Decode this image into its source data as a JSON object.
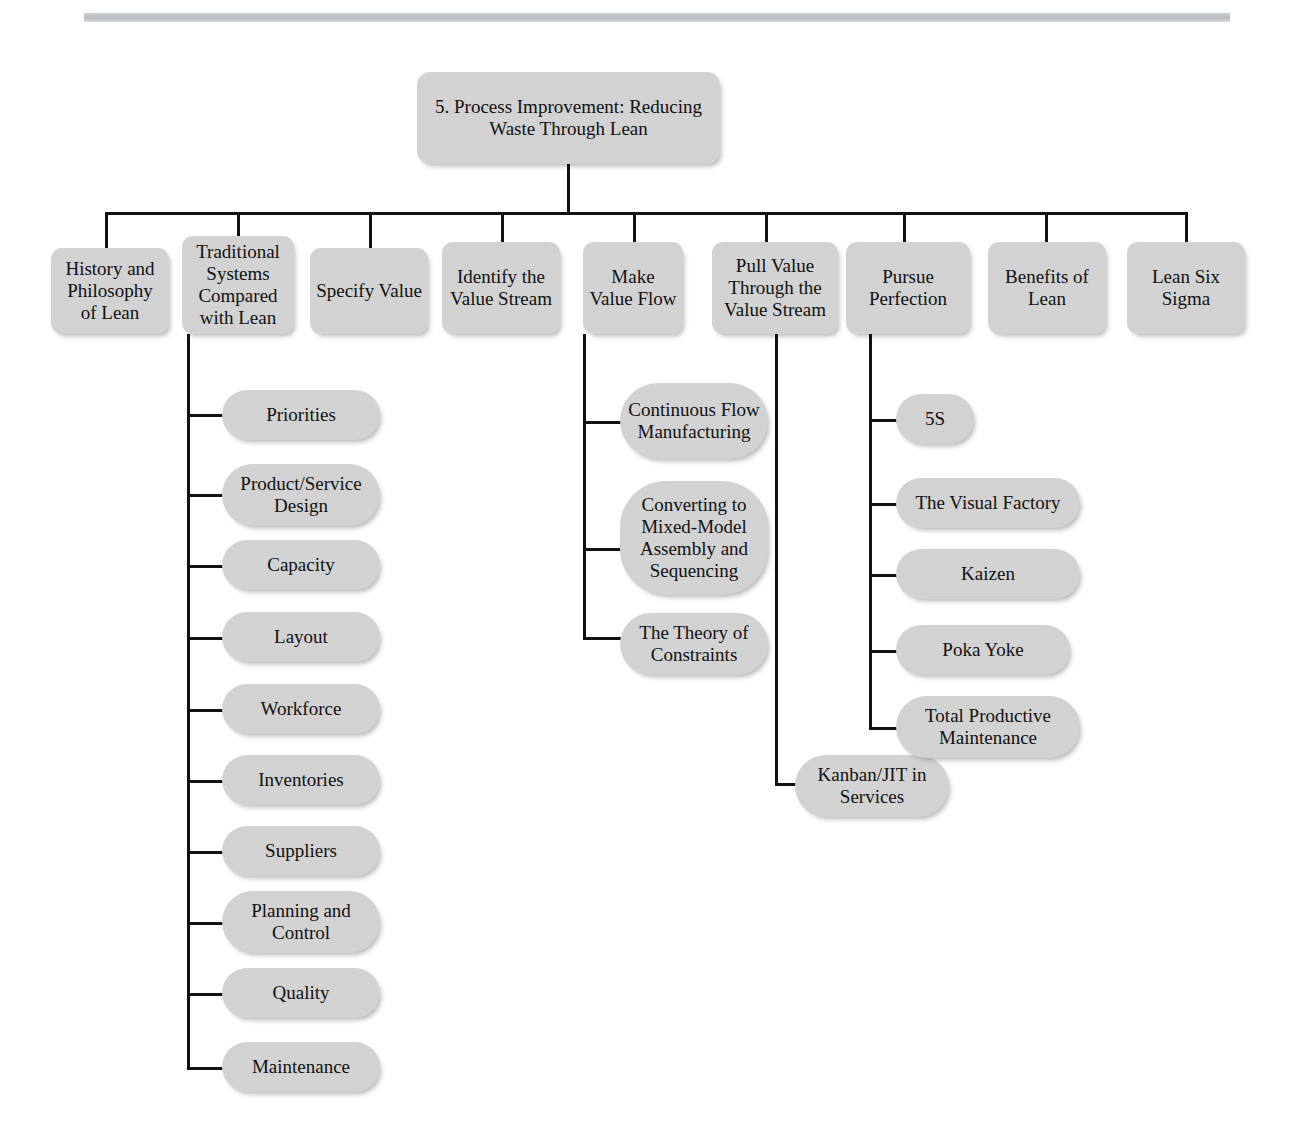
{
  "page": {
    "header_rule_text": "",
    "background_color": "#ffffff",
    "node_fill_color": "#d2d2d2",
    "connector_color": "#111111",
    "text_color": "#111111"
  },
  "chart_title": "5. Process Improvement: Reducing Waste Through Lean",
  "root": {
    "label": "5. Process Improvement: Reducing Waste Through Lean"
  },
  "level1": [
    {
      "id": "history",
      "label": "History and Philosophy of Lean"
    },
    {
      "id": "traditional",
      "label": "Traditional Systems Compared with Lean"
    },
    {
      "id": "specify",
      "label": "Specify Value"
    },
    {
      "id": "identify",
      "label": "Identify the Value Stream"
    },
    {
      "id": "makeflow",
      "label": "Make Value Flow"
    },
    {
      "id": "pullvalue",
      "label": "Pull Value Through the Value Stream"
    },
    {
      "id": "pursue",
      "label": "Pursue Perfection"
    },
    {
      "id": "benefits",
      "label": "Benefits of Lean"
    },
    {
      "id": "sixsigma",
      "label": "Lean Six Sigma"
    }
  ],
  "traditional_children": [
    {
      "label": "Priorities"
    },
    {
      "label": "Product/Service Design"
    },
    {
      "label": "Capacity"
    },
    {
      "label": "Layout"
    },
    {
      "label": "Workforce"
    },
    {
      "label": "Inventories"
    },
    {
      "label": "Suppliers"
    },
    {
      "label": "Planning and Control"
    },
    {
      "label": "Quality"
    },
    {
      "label": "Maintenance"
    }
  ],
  "makeflow_children": [
    {
      "label": "Continuous Flow Manufacturing"
    },
    {
      "label": "Converting to Mixed-Model Assembly and Sequencing"
    },
    {
      "label": "The Theory of Constraints"
    }
  ],
  "pullvalue_children": [
    {
      "label": "Kanban/JIT in Services"
    }
  ],
  "pursue_children": [
    {
      "label": "5S"
    },
    {
      "label": "The Visual Factory"
    },
    {
      "label": "Kaizen"
    },
    {
      "label": "Poka Yoke"
    },
    {
      "label": "Total Productive Maintenance"
    }
  ]
}
